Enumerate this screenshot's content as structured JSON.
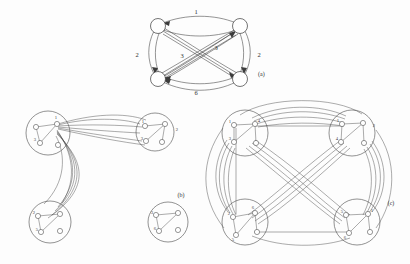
{
  "figure": {
    "background_color": "#fdfdfd",
    "line_color": "#3c3c3c",
    "node_fill": "#ffffff"
  },
  "panels": [
    {
      "id": "a",
      "label": "(a)",
      "kind": "directed-multigraph",
      "node_count": 4,
      "nodes": [
        {
          "id": "n1",
          "label": "",
          "x": 158,
          "y": 26
        },
        {
          "id": "n2",
          "label": "",
          "x": 240,
          "y": 26
        },
        {
          "id": "n3",
          "label": "",
          "x": 158,
          "y": 79
        },
        {
          "id": "n4",
          "label": "",
          "x": 240,
          "y": 79
        }
      ],
      "edge_labels": [
        {
          "text": "1",
          "x": 196,
          "y": 14
        },
        {
          "text": "2",
          "x": 137,
          "y": 57
        },
        {
          "text": "3",
          "x": 182,
          "y": 58
        },
        {
          "text": "3",
          "x": 216,
          "y": 50
        },
        {
          "text": "2",
          "x": 259,
          "y": 57
        },
        {
          "text": "6",
          "x": 196,
          "y": 95
        }
      ]
    },
    {
      "id": "b",
      "label": "(b)",
      "kind": "clustered-graph",
      "cluster_count": 3,
      "clusters": [
        {
          "id": "c1",
          "label": "1",
          "cx": 48,
          "cy": 133,
          "r": 22,
          "nodes": [
            {
              "label": "1",
              "x": 57,
              "y": 124
            },
            {
              "label": "",
              "x": 36,
              "y": 127
            },
            {
              "label": "3",
              "x": 40,
              "y": 143
            },
            {
              "label": "",
              "x": 58,
              "y": 145
            }
          ]
        },
        {
          "id": "c2",
          "label": "2",
          "cx": 155,
          "cy": 132,
          "r": 19,
          "nodes": [
            {
              "label": "1",
              "x": 145,
              "y": 126
            },
            {
              "label": "",
              "x": 165,
              "y": 124
            },
            {
              "label": "3",
              "x": 146,
              "y": 141
            },
            {
              "label": "",
              "x": 162,
              "y": 142
            }
          ]
        },
        {
          "id": "c3",
          "label": "",
          "cx": 50,
          "cy": 222,
          "r": 21,
          "nodes": [
            {
              "label": "2",
              "x": 38,
              "y": 216
            },
            {
              "label": "",
              "x": 60,
              "y": 214
            },
            {
              "label": "5",
              "x": 41,
              "y": 232
            },
            {
              "label": "",
              "x": 60,
              "y": 231
            }
          ]
        },
        {
          "id": "c4",
          "label": "",
          "cx": 168,
          "cy": 222,
          "r": 20,
          "nodes": [
            {
              "label": "3",
              "x": 156,
              "y": 215
            },
            {
              "label": "",
              "x": 178,
              "y": 213
            },
            {
              "label": "6",
              "x": 159,
              "y": 231
            },
            {
              "label": "",
              "x": 178,
              "y": 230
            }
          ]
        }
      ],
      "panel_label_pos": {
        "x": 181,
        "y": 197
      }
    },
    {
      "id": "c",
      "label": "(c)",
      "kind": "clustered-graph",
      "cluster_count": 4,
      "clusters": [
        {
          "id": "tl",
          "label": "",
          "cx": 245,
          "cy": 133,
          "r": 23,
          "nodes": [
            {
              "label": "1",
              "x": 234,
              "y": 125
            },
            {
              "label": "4",
              "x": 255,
              "y": 124
            },
            {
              "label": "3",
              "x": 234,
              "y": 142
            },
            {
              "label": "",
              "x": 256,
              "y": 143
            }
          ]
        },
        {
          "id": "tr",
          "label": "2",
          "cx": 352,
          "cy": 133,
          "r": 23,
          "nodes": [
            {
              "label": "1",
              "x": 342,
              "y": 124
            },
            {
              "label": "",
              "x": 363,
              "y": 123
            },
            {
              "label": "4",
              "x": 341,
              "y": 142
            },
            {
              "label": "",
              "x": 364,
              "y": 143
            }
          ]
        },
        {
          "id": "bl",
          "label": "",
          "cx": 245,
          "cy": 222,
          "r": 23,
          "nodes": [
            {
              "label": "2",
              "x": 233,
              "y": 217
            },
            {
              "label": "6",
              "x": 255,
              "y": 213
            },
            {
              "label": "5",
              "x": 236,
              "y": 235
            },
            {
              "label": "",
              "x": 257,
              "y": 232
            }
          ]
        },
        {
          "id": "br",
          "label": "",
          "cx": 357,
          "cy": 222,
          "r": 23,
          "nodes": [
            {
              "label": "5",
              "x": 346,
              "y": 215
            },
            {
              "label": "1",
              "x": 368,
              "y": 214
            },
            {
              "label": "6",
              "x": 349,
              "y": 233
            },
            {
              "label": "",
              "x": 370,
              "y": 232
            }
          ]
        }
      ],
      "panel_label_pos": {
        "x": 391,
        "y": 205
      }
    }
  ]
}
